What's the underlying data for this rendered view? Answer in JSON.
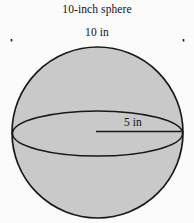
{
  "figure": {
    "title": "10-inch sphere",
    "shape": "sphere",
    "background_color": "#fbfbfc",
    "fill_color": "#c9c9c9",
    "stroke_color": "#1a1a1a",
    "labels": {
      "overall_width": "10 in",
      "radius": "5 in"
    },
    "dimensions": {
      "diameter_value": 10,
      "diameter_unit": "in",
      "radius_value": 5,
      "radius_unit": "in"
    },
    "annotations": {
      "dimension_line_name": "diameter-dimension-line",
      "radius_line_name": "radius-leader-line",
      "equator_name": "equator-ellipse"
    }
  }
}
